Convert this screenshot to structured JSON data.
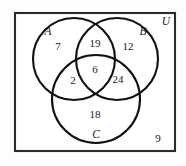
{
  "chart_data": {
    "type": "diagram",
    "diagram_kind": "venn-3-set",
    "title": "",
    "universe_label": "U",
    "outside_value": 9,
    "sets": [
      {
        "id": "A",
        "label": "A",
        "cx": 74,
        "cy": 59,
        "r": 41
      },
      {
        "id": "B",
        "label": "B",
        "cx": 117,
        "cy": 59,
        "r": 41
      },
      {
        "id": "C",
        "label": "C",
        "cx": 96,
        "cy": 99,
        "r": 44
      }
    ],
    "regions": [
      {
        "id": "A_only",
        "label": "A only",
        "value": 7,
        "x": 58,
        "y": 47
      },
      {
        "id": "AB_only",
        "label": "A and B only",
        "value": 19,
        "x": 95,
        "y": 44
      },
      {
        "id": "B_only",
        "label": "B only",
        "value": 12,
        "x": 128,
        "y": 47
      },
      {
        "id": "AC_only",
        "label": "A and C only",
        "value": 2,
        "x": 73,
        "y": 81
      },
      {
        "id": "ABC",
        "label": "A and B and C",
        "value": 6,
        "x": 95,
        "y": 70
      },
      {
        "id": "BC_only",
        "label": "B and C only",
        "value": 24,
        "x": 118,
        "y": 80
      },
      {
        "id": "C_only",
        "label": "C only",
        "value": 18,
        "x": 95,
        "y": 115
      },
      {
        "id": "outside",
        "label": "Outside all sets",
        "value": 9,
        "x": 158,
        "y": 139
      }
    ],
    "set_label_positions": [
      {
        "id": "A",
        "x": 48,
        "y": 32
      },
      {
        "id": "B",
        "x": 143,
        "y": 32
      },
      {
        "id": "C",
        "x": 96,
        "y": 135
      },
      {
        "id": "U",
        "x": 166,
        "y": 22
      }
    ],
    "universe_rect": {
      "x": 15,
      "y": 13,
      "width": 160,
      "height": 138
    },
    "colors": {
      "background": "#fdfdfd",
      "stroke": "#111111",
      "rect_stroke": "#2b2b2b",
      "text": "#1a1a1a"
    }
  }
}
